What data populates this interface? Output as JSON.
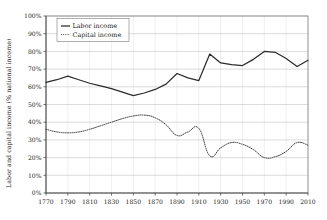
{
  "chart_data": {
    "type": "line",
    "title": "",
    "xlabel": "",
    "ylabel": "Labor and capital income (% national income)",
    "xlim": [
      1770,
      2010
    ],
    "ylim": [
      0,
      100
    ],
    "grid": true,
    "legend_position": "top-left",
    "y_tick_labels": [
      "0%",
      "10%",
      "20%",
      "30%",
      "40%",
      "50%",
      "60%",
      "70%",
      "80%",
      "90%",
      "100%"
    ],
    "y_tick_values": [
      0,
      10,
      20,
      30,
      40,
      50,
      60,
      70,
      80,
      90,
      100
    ],
    "x_tick_labels": [
      "1770",
      "1790",
      "1810",
      "1830",
      "1850",
      "1870",
      "1890",
      "1910",
      "1930",
      "1950",
      "1970",
      "1990",
      "2010"
    ],
    "x_tick_values": [
      1770,
      1790,
      1810,
      1830,
      1850,
      1870,
      1890,
      1910,
      1930,
      1950,
      1970,
      1990,
      2010
    ],
    "series": [
      {
        "name": "Labor income",
        "style": "solid",
        "color": "#2b2b2b",
        "x": [
          1770,
          1780,
          1790,
          1800,
          1810,
          1820,
          1830,
          1840,
          1850,
          1860,
          1870,
          1880,
          1890,
          1900,
          1910,
          1920,
          1930,
          1940,
          1950,
          1960,
          1970,
          1980,
          1990,
          2000,
          2010
        ],
        "values": [
          62.5,
          64.0,
          66.0,
          64.0,
          62.0,
          60.5,
          59.0,
          57.0,
          55.0,
          56.5,
          58.5,
          61.5,
          67.5,
          65.0,
          63.5,
          78.5,
          73.5,
          72.5,
          72.0,
          75.5,
          80.0,
          79.5,
          76.0,
          71.5,
          75.0
        ]
      },
      {
        "name": "Capital income",
        "style": "dotted",
        "color": "#2b2b2b",
        "x": [
          1770,
          1780,
          1790,
          1800,
          1810,
          1820,
          1830,
          1840,
          1850,
          1860,
          1870,
          1880,
          1890,
          1900,
          1910,
          1920,
          1930,
          1940,
          1950,
          1960,
          1970,
          1980,
          1990,
          2000,
          2010
        ],
        "values": [
          36.0,
          34.5,
          34.0,
          34.5,
          36.0,
          38.0,
          40.0,
          42.0,
          43.5,
          44.0,
          42.5,
          38.5,
          32.5,
          34.5,
          36.5,
          21.0,
          25.5,
          28.5,
          27.5,
          24.5,
          20.0,
          20.5,
          23.5,
          28.5,
          27.0
        ]
      }
    ]
  },
  "legend": {
    "items": [
      {
        "label": "Labor income",
        "style": "solid"
      },
      {
        "label": "Capital income",
        "style": "dotted"
      }
    ]
  },
  "axes": {
    "y_title": "Labor and capital income (% national income)"
  }
}
